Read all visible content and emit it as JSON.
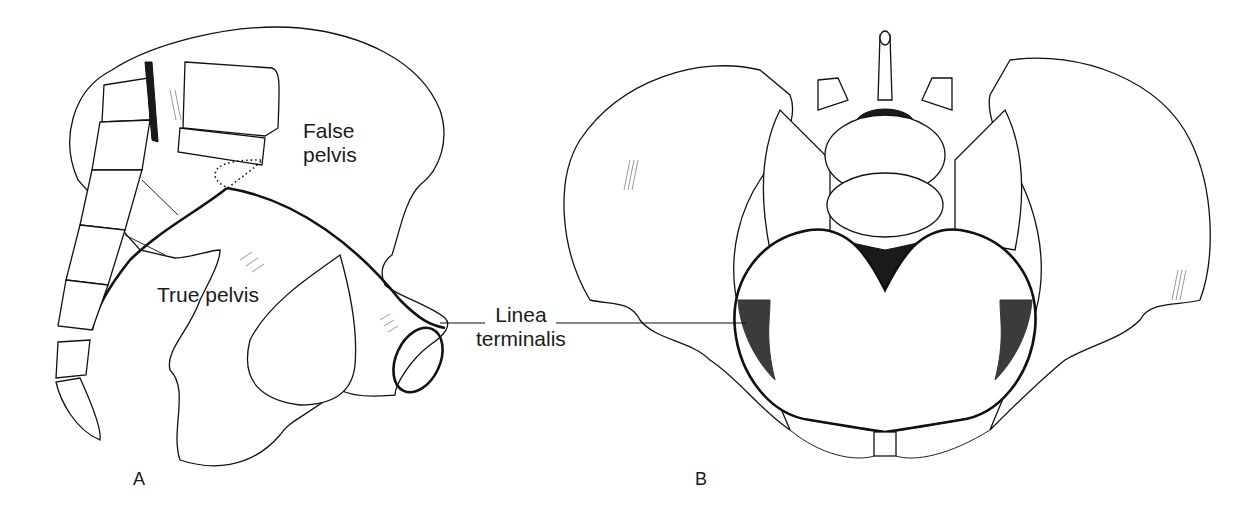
{
  "figure": {
    "panels": [
      {
        "id": "A",
        "letter": "A",
        "view": "lateral view of hemipelvis with sacrum and coccyx",
        "labels": {
          "false_pelvis": "False\npelvis",
          "true_pelvis": "True pelvis"
        }
      },
      {
        "id": "B",
        "letter": "B",
        "view": "superior view of pelvis with lumbar vertebra"
      }
    ],
    "shared_label": {
      "linea_terminalis": "Linea\nterminalis"
    },
    "colors": {
      "background": "#ffffff",
      "ink": "#111111"
    }
  }
}
